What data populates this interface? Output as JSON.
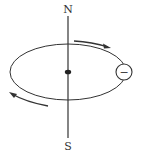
{
  "diagram": {
    "type": "orbit-electron-diagram",
    "labels": {
      "north": "N",
      "south": "S"
    },
    "electron": {
      "symbol": "−",
      "charge": "negative"
    },
    "arrows": {
      "top": "clockwise-right",
      "bottom": "clockwise-left"
    },
    "colors": {
      "stroke": "#333333",
      "background": "#ffffff"
    }
  }
}
